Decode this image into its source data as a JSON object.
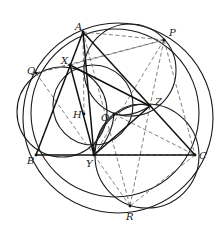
{
  "diagram": {
    "type": "geometry-figure",
    "colors": {
      "stroke": "#1a1a1a",
      "dashed": "#555555",
      "background": "#ffffff",
      "label": "#222222"
    },
    "points": [
      {
        "name": "A",
        "x": 83,
        "y": 32,
        "lx": 75,
        "ly": 30
      },
      {
        "name": "P",
        "x": 164,
        "y": 40,
        "lx": 169,
        "ly": 36
      },
      {
        "name": "X",
        "x": 70,
        "y": 65,
        "lx": 61,
        "ly": 64
      },
      {
        "name": "Q",
        "x": 36,
        "y": 73,
        "lx": 27,
        "ly": 74
      },
      {
        "name": "H",
        "x": 84,
        "y": 114,
        "lx": 73,
        "ly": 118
      },
      {
        "name": "O",
        "x": 114,
        "y": 114,
        "lx": 101,
        "ly": 121
      },
      {
        "name": "Z",
        "x": 150,
        "y": 106,
        "lx": 155,
        "ly": 105
      },
      {
        "name": "B",
        "x": 36,
        "y": 155,
        "lx": 27,
        "ly": 164
      },
      {
        "name": "Y",
        "x": 94,
        "y": 155,
        "lx": 86,
        "ly": 167
      },
      {
        "name": "C",
        "x": 195,
        "y": 155,
        "lx": 199,
        "ly": 159
      },
      {
        "name": "R",
        "x": 130,
        "y": 206,
        "lx": 126,
        "ly": 220
      }
    ],
    "solid_segments": [
      [
        "A",
        "B"
      ],
      [
        "A",
        "C"
      ],
      [
        "B",
        "C"
      ],
      [
        "A",
        "Y"
      ],
      [
        "X",
        "Z"
      ],
      [
        "Y",
        "Z"
      ],
      [
        "X",
        "Y"
      ]
    ],
    "dashed_segments": [
      [
        "A",
        "P"
      ],
      [
        "A",
        "H"
      ],
      [
        "A",
        "R"
      ],
      [
        "Q",
        "X"
      ],
      [
        "Q",
        "Y"
      ],
      [
        "Q",
        "P"
      ],
      [
        "X",
        "P"
      ],
      [
        "P",
        "Y"
      ],
      [
        "P",
        "C"
      ],
      [
        "P",
        "Z"
      ],
      [
        "Y",
        "R"
      ],
      [
        "Z",
        "R"
      ],
      [
        "C",
        "R"
      ],
      [
        "O",
        "C"
      ],
      [
        "Y",
        "C"
      ]
    ],
    "circles": [
      {
        "name": "outer-large-circle",
        "cx": 118,
        "cy": 118,
        "r": 95
      },
      {
        "name": "circumcircle-ABC",
        "cx": 115,
        "cy": 113,
        "r": 84
      },
      {
        "name": "circle-AXOZP",
        "cx": 130,
        "cy": 70,
        "r": 46
      },
      {
        "name": "circle-QXBY",
        "cx": 62,
        "cy": 112,
        "r": 45
      },
      {
        "name": "circle-YZCR",
        "cx": 147,
        "cy": 156,
        "r": 52
      },
      {
        "name": "circle-XOY",
        "cx": 93,
        "cy": 105,
        "r": 40
      }
    ],
    "arcs": [
      {
        "name": "lens-OZ-upper",
        "d": "M114,114 Q132,100 150,106"
      },
      {
        "name": "lens-OZ-lower",
        "d": "M114,114 Q132,118 150,106"
      },
      {
        "name": "lens-OY-left",
        "d": "M114,114 Q96,128 94,155"
      },
      {
        "name": "lens-OY-right",
        "d": "M114,114 Q112,138 94,155"
      }
    ]
  }
}
